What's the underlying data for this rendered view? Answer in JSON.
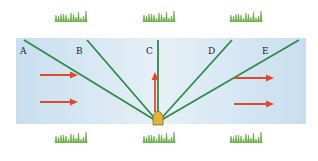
{
  "diagram": {
    "river": {
      "color": "#cfe3f1",
      "x": 16,
      "y": 38,
      "width": 290,
      "height": 86
    },
    "lines": [
      {
        "label": "A",
        "x1": 24,
        "y1": 40,
        "label_x": 20,
        "label_y": 47
      },
      {
        "label": "B",
        "x1": 87,
        "y1": 40,
        "label_x": 76,
        "label_y": 47
      },
      {
        "label": "C",
        "x1": 158,
        "y1": 40,
        "label_x": 146,
        "label_y": 47
      },
      {
        "label": "D",
        "x1": 232,
        "y1": 40,
        "label_x": 208,
        "label_y": 47
      },
      {
        "label": "E",
        "x1": 299,
        "y1": 40,
        "label_x": 262,
        "label_y": 47
      }
    ],
    "apex": {
      "x": 158,
      "y": 122
    },
    "line_color": "#2e8b4a",
    "arrow_color": "#e04a2a",
    "current_arrows": [
      {
        "x1": 40,
        "y1": 75,
        "x2": 76,
        "y2": 75
      },
      {
        "x1": 40,
        "y1": 102,
        "x2": 76,
        "y2": 102
      },
      {
        "x1": 234,
        "y1": 78,
        "x2": 272,
        "y2": 78
      },
      {
        "x1": 234,
        "y1": 104,
        "x2": 272,
        "y2": 104
      }
    ],
    "boat_arrow": {
      "x1": 155,
      "y1": 112,
      "x2": 155,
      "y2": 74
    },
    "grass_color": "#6db33f",
    "grass_top": [
      {
        "x": 55,
        "y": 14
      },
      {
        "x": 143,
        "y": 14
      },
      {
        "x": 230,
        "y": 14
      }
    ],
    "grass_bottom": [
      {
        "x": 55,
        "y": 135
      },
      {
        "x": 143,
        "y": 135
      },
      {
        "x": 230,
        "y": 135
      }
    ]
  }
}
